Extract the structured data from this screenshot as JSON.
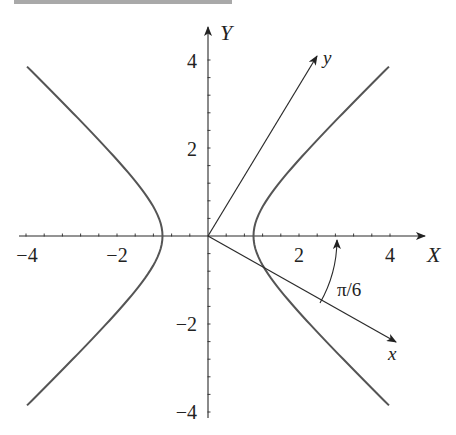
{
  "figure": {
    "top_bar": true,
    "axes": {
      "X_label": "X",
      "Y_label": "Y",
      "x_ticks": [
        {
          "value": -4,
          "label": "−4"
        },
        {
          "value": -2,
          "label": "−2"
        },
        {
          "value": 2,
          "label": "2"
        },
        {
          "value": 4,
          "label": "4"
        }
      ],
      "y_ticks": [
        {
          "value": 4,
          "label": "4"
        },
        {
          "value": 2,
          "label": "2"
        },
        {
          "value": -2,
          "label": "−2"
        },
        {
          "value": -4,
          "label": "−4"
        }
      ],
      "minor_tick_step": 0.4,
      "x_range": [
        -4.2,
        4.8
      ],
      "y_range": [
        -4.1,
        4.8
      ]
    },
    "rotated_axes": {
      "x_label": "x",
      "y_label": "y",
      "angle_label": "π/6",
      "rotation_angle_deg": -30
    },
    "curve": {
      "equation": "X^2 - Y^2 = 1",
      "a": 1,
      "b": 1,
      "y_extent": 3.85,
      "color": "#555555"
    }
  }
}
